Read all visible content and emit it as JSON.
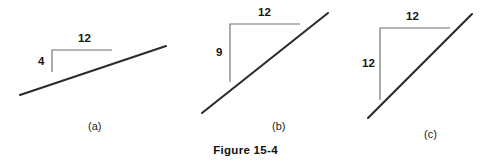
{
  "figure": {
    "caption": "Figure 15-4",
    "background_color": "#ffffff",
    "line_color": "#2b2b2b",
    "marker_color": "#6f6f6f",
    "text_color": "#151515",
    "width": 491,
    "height": 166
  },
  "chart_data": {
    "type": "line",
    "title": "Figure 15-4",
    "xlabel": "",
    "ylabel": "",
    "panels": [
      {
        "id": "a",
        "label": "(a)",
        "rise": 4,
        "run": 12,
        "rise_label": "4",
        "run_label": "12",
        "slope": 0.3333,
        "line": {
          "x1": 20,
          "y1": 95,
          "x2": 166,
          "y2": 46
        },
        "marker": {
          "corner_x": 52,
          "corner_y": 50,
          "horizontal_end_x": 112,
          "vertical_end_y": 72
        },
        "run_label_pos": {
          "x": 78,
          "y": 32
        },
        "rise_label_pos": {
          "x": 38,
          "y": 55
        },
        "panel_label_pos": {
          "x": 88,
          "y": 120
        }
      },
      {
        "id": "b",
        "label": "(b)",
        "rise": 9,
        "run": 12,
        "rise_label": "9",
        "run_label": "12",
        "slope": 0.75,
        "line": {
          "x1": 202,
          "y1": 113,
          "x2": 328,
          "y2": 13
        },
        "marker": {
          "corner_x": 230,
          "corner_y": 24,
          "horizontal_end_x": 300,
          "vertical_end_y": 82
        },
        "run_label_pos": {
          "x": 258,
          "y": 6
        },
        "rise_label_pos": {
          "x": 216,
          "y": 46
        },
        "panel_label_pos": {
          "x": 272,
          "y": 120
        }
      },
      {
        "id": "c",
        "label": "(c)",
        "rise": 12,
        "run": 12,
        "rise_label": "12",
        "run_label": "12",
        "slope": 1.0,
        "line": {
          "x1": 368,
          "y1": 118,
          "x2": 472,
          "y2": 14
        },
        "marker": {
          "corner_x": 380,
          "corner_y": 28,
          "horizontal_end_x": 450,
          "vertical_end_y": 100
        },
        "run_label_pos": {
          "x": 406,
          "y": 10
        },
        "rise_label_pos": {
          "x": 362,
          "y": 57
        },
        "panel_label_pos": {
          "x": 424,
          "y": 128
        }
      }
    ]
  }
}
